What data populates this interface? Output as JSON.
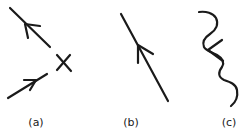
{
  "diagram": {
    "stroke_color": "#1a1a1a",
    "background": "#ffffff",
    "panels": [
      {
        "id": "a",
        "label": "(a)",
        "description": "Two straight line segments with arrows meeting near an X (annihilation/vertex)",
        "elements": [
          "upper-line-arrow-up-left",
          "x-cross-mark",
          "lower-line-arrow-up-right"
        ]
      },
      {
        "id": "b",
        "label": "(b)",
        "description": "Single straight line with an arrow pointing up-left",
        "elements": [
          "straight-line-arrow-up"
        ]
      },
      {
        "id": "c",
        "label": "(c)",
        "description": "Wavy line with an arrow pointing left",
        "elements": [
          "wavy-line-arrow-left"
        ]
      }
    ]
  }
}
